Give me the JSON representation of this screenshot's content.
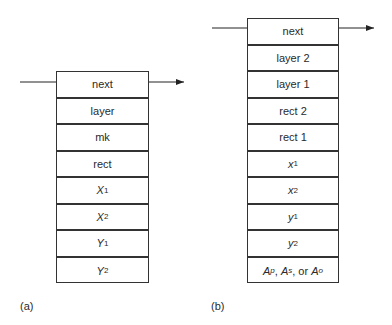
{
  "diagram_a": {
    "caption": "(a)",
    "fields": [
      {
        "label": "next",
        "italic": false
      },
      {
        "label": "layer",
        "italic": false
      },
      {
        "label": "mk",
        "italic": false
      },
      {
        "label": "rect",
        "italic": false
      },
      {
        "base": "X",
        "sub": "1",
        "italic": true
      },
      {
        "base": "X",
        "sub": "2",
        "italic": true
      },
      {
        "base": "Y",
        "sub": "1",
        "italic": true
      },
      {
        "base": "Y",
        "sub": "2",
        "italic": true
      }
    ]
  },
  "diagram_b": {
    "caption": "(b)",
    "fields": [
      {
        "label": "next",
        "italic": false
      },
      {
        "label": "layer 2",
        "italic": false
      },
      {
        "label": "layer 1",
        "italic": false
      },
      {
        "label": "rect 2",
        "italic": false
      },
      {
        "label": "rect 1",
        "italic": false
      },
      {
        "base": "x",
        "sub": "1",
        "italic": true
      },
      {
        "base": "x",
        "sub": "2",
        "italic": true
      },
      {
        "base": "y",
        "sub": "1",
        "italic": true
      },
      {
        "base": "y",
        "sub": "2",
        "italic": true
      },
      {
        "area": [
          "A",
          "p",
          "A",
          "s",
          "A",
          "o"
        ],
        "label": "Ap, As, or Ao"
      }
    ]
  }
}
